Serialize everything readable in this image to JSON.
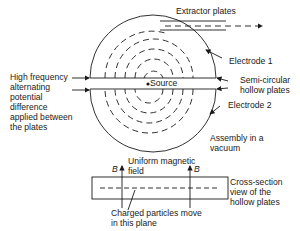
{
  "diagram": {
    "labels": {
      "extractor_plates": "Extractor plates",
      "electrode_1": "Electrode 1",
      "semi_circular_1": "Semi-circular",
      "semi_circular_2": "hollow plates",
      "electrode_2": "Electrode 2",
      "high_freq_1": "High frequency",
      "high_freq_2": "alternating",
      "high_freq_3": "potential",
      "high_freq_4": "difference",
      "high_freq_5": "applied between",
      "high_freq_6": "the plates",
      "source": "Source",
      "assembly_1": "Assembly in a",
      "assembly_2": "vacuum",
      "uniform_1": "Uniform magnetic",
      "uniform_2": "field",
      "b_left": "B",
      "b_right": "B",
      "cross_1": "Cross-section",
      "cross_2": "view of the",
      "cross_3": "hollow plates",
      "charged_1": "Charged particles move",
      "charged_2": "in this plane"
    },
    "colors": {
      "line": "#1a1a1a",
      "background": "#ffffff"
    }
  }
}
